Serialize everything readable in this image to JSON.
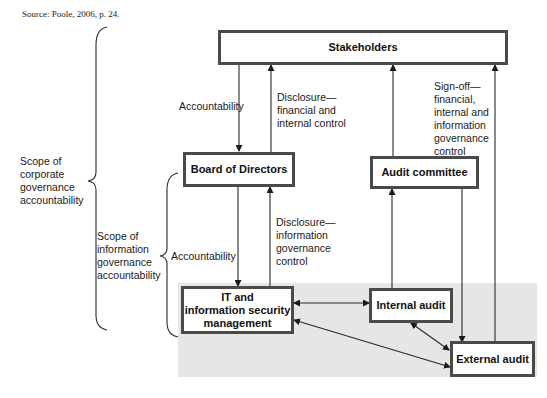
{
  "source": "Source: Poole, 2006, p. 24.",
  "nodes": {
    "stakeholders": "Stakeholders",
    "board": "Board of Directors",
    "audit_committee": "Audit committee",
    "it_security": "IT and information security management",
    "internal_audit": "Internal audit",
    "external_audit": "External audit"
  },
  "it_security_lines": [
    "IT and",
    "information security",
    "management"
  ],
  "edge_labels": {
    "accountability_top": "Accountability",
    "disclosure_financial": [
      "Disclosure—",
      "financial and",
      "internal control"
    ],
    "signoff": [
      "Sign-off—",
      "financial,",
      "internal and",
      "information",
      "governance",
      "control"
    ],
    "accountability_bottom": "Accountability",
    "disclosure_info": [
      "Disclosure—",
      "information",
      "governance",
      "control"
    ]
  },
  "scopes": {
    "corporate": [
      "Scope of",
      "corporate",
      "governance",
      "accountability"
    ],
    "information": [
      "Scope of",
      "information",
      "governance",
      "accountability"
    ]
  },
  "colors": {
    "box_border": "#4a4a4a",
    "line": "#2a2a2a",
    "shade": "#e6e6e6"
  }
}
